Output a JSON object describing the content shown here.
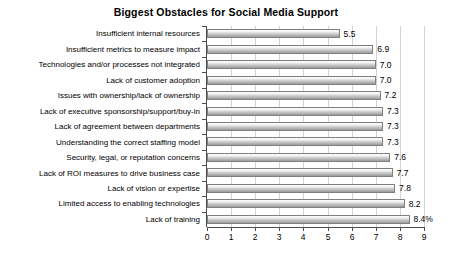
{
  "chart_data": {
    "type": "bar",
    "orientation": "horizontal",
    "title": "Biggest Obstacles for Social Media Support",
    "xlabel": "",
    "ylabel": "",
    "xlim": [
      0,
      9
    ],
    "xticks": [
      "0",
      "1",
      "2",
      "3",
      "4",
      "5",
      "6",
      "7",
      "8",
      "9"
    ],
    "grid": "vertical",
    "legend": "none",
    "categories": [
      "Insufficient internal resources",
      "Insufficient metrics to measure impact",
      "Technologies and/or processes not integrated",
      "Lack of customer adoption",
      "Issues with ownership/lack of ownership",
      "Lack of executive sponsorship/support/buy-in",
      "Lack of agreement between departments",
      "Understanding the correct staffing model",
      "Security, legal, or reputation concerns",
      "Lack of ROI measures to drive business case",
      "Lack of vision or expertise",
      "Limited access to enabling technologies",
      "Lack of training"
    ],
    "values": [
      5.5,
      6.9,
      7.0,
      7.0,
      7.2,
      7.3,
      7.3,
      7.3,
      7.6,
      7.7,
      7.8,
      8.2,
      8.4
    ],
    "data_labels": [
      "5.5",
      "6.9",
      "7.0",
      "7.0",
      "7.2",
      "7.3",
      "7.3",
      "7.3",
      "7.6",
      "7.7",
      "7.8",
      "8.2",
      "8.4%"
    ],
    "colors": {
      "bar_fill_light": "#f2f2f2",
      "bar_fill_mid": "#cfcfcf",
      "bar_fill_dark": "#9a9a9a",
      "bar_border": "#808080",
      "gridline": "#d2d2d2",
      "axis": "#4d4d4d",
      "text": "#000000",
      "background": "#ffffff"
    }
  }
}
